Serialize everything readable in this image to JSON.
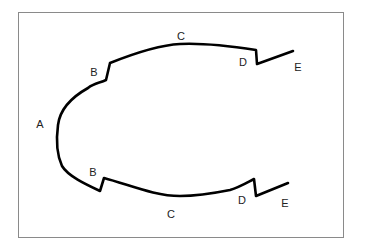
{
  "diagram": {
    "stroke_color": "#000000",
    "frame_color": "#8a8a8a",
    "labels": [
      {
        "id": "A",
        "text": "A",
        "x": 40,
        "y": 124
      },
      {
        "id": "B-top",
        "text": "B",
        "x": 94,
        "y": 72
      },
      {
        "id": "C-top",
        "text": "C",
        "x": 181,
        "y": 36
      },
      {
        "id": "D-top",
        "text": "D",
        "x": 243,
        "y": 62
      },
      {
        "id": "E-top",
        "text": "E",
        "x": 298,
        "y": 67
      },
      {
        "id": "B-bottom",
        "text": "B",
        "x": 93,
        "y": 172
      },
      {
        "id": "C-bottom",
        "text": "C",
        "x": 171,
        "y": 214
      },
      {
        "id": "D-bottom",
        "text": "D",
        "x": 242,
        "y": 200
      },
      {
        "id": "E-bottom",
        "text": "E",
        "x": 285,
        "y": 203
      }
    ]
  }
}
